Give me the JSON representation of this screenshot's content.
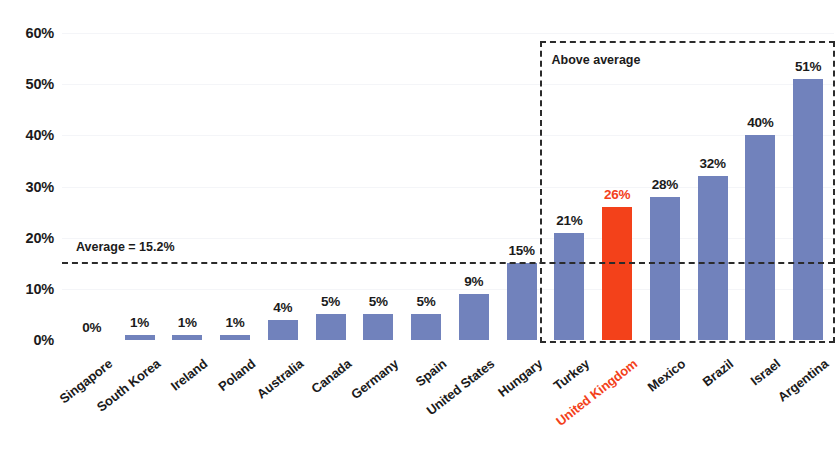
{
  "chart_data": {
    "type": "bar",
    "title": "",
    "subtitle": "",
    "xlabel": "",
    "ylabel": "",
    "ylim": [
      0,
      60
    ],
    "ytick_labels": [
      "0%",
      "10%",
      "20%",
      "30%",
      "40%",
      "50%",
      "60%"
    ],
    "ytick_values": [
      0,
      10,
      20,
      30,
      40,
      50,
      60
    ],
    "grid": true,
    "legend": "none",
    "categories": [
      "Singapore",
      "South Korea",
      "Ireland",
      "Poland",
      "Australia",
      "Canada",
      "Germany",
      "Spain",
      "United States",
      "Hungary",
      "Turkey",
      "United Kingdom",
      "Mexico",
      "Brazil",
      "Israel",
      "Argentina"
    ],
    "values": [
      0,
      1,
      1,
      1,
      4,
      5,
      5,
      5,
      9,
      15,
      21,
      26,
      28,
      32,
      40,
      51
    ],
    "value_labels": [
      "0%",
      "1%",
      "1%",
      "1%",
      "4%",
      "5%",
      "5%",
      "5%",
      "9%",
      "15%",
      "21%",
      "26%",
      "28%",
      "32%",
      "40%",
      "51%"
    ],
    "highlight_category": "United Kingdom",
    "highlight_index": 11,
    "bar_color": "#7182bc",
    "highlight_color": "#f3411a",
    "annotations": [
      {
        "name": "average-line",
        "label": "Average = 15.2%",
        "value": 15.2,
        "style": "dashed-horizontal-line"
      },
      {
        "name": "above-average-box",
        "label": "Above average",
        "style": "dashed-rectangle",
        "covers_from_index": 10,
        "covers_to_index": 15
      }
    ]
  }
}
